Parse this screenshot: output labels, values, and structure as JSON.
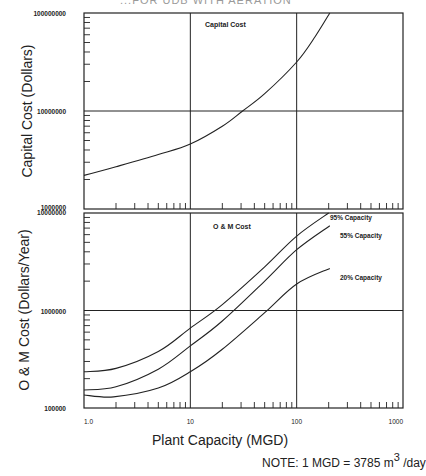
{
  "header": {
    "title_fragment": "...FOR UDB WITH AERATION"
  },
  "labels": {
    "top_ylabel": "Capital Cost (Dollars)",
    "bottom_ylabel": "O & M Cost (Dollars/Year)",
    "xlabel": "Plant Capacity (MGD)",
    "note_prefix": "NOTE: 1 MGD = 3785 m",
    "note_exp": "3",
    "note_suffix": " /day"
  },
  "chart_data": [
    {
      "type": "line",
      "title": "Capital Cost",
      "xlabel": "Plant Capacity (MGD)",
      "ylabel": "Capital Cost (Dollars)",
      "xscale": "log",
      "yscale": "log",
      "xlim": [
        1,
        1000
      ],
      "ylim": [
        1000000,
        100000000
      ],
      "x_tick_labels": [
        "1.0",
        "10",
        "100",
        "1000"
      ],
      "y_tick_labels": [
        "1000000",
        "10000000",
        "100000000"
      ],
      "grid": true,
      "series": [
        {
          "name": "Capital Cost",
          "x": [
            1,
            2,
            5,
            10,
            20,
            31,
            50,
            100,
            150,
            205
          ],
          "y": [
            2200000,
            2700000,
            3600000,
            4600000,
            7000000,
            10000000,
            15000000,
            31600000,
            58000000,
            100000000
          ]
        }
      ]
    },
    {
      "type": "line",
      "title": "O & M Cost",
      "xlabel": "Plant Capacity (MGD)",
      "ylabel": "O & M Cost (Dollars/Year)",
      "xscale": "log",
      "yscale": "log",
      "xlim": [
        1,
        1000
      ],
      "ylim": [
        100000,
        10000000
      ],
      "x_tick_labels": [
        "1.0",
        "10",
        "100",
        "1000"
      ],
      "y_tick_labels": [
        "100000",
        "1000000",
        "10000000"
      ],
      "grid": true,
      "legend_position": "inline-right",
      "series": [
        {
          "name": "95% Capacity",
          "x": [
            1,
            2,
            5,
            10,
            20,
            50,
            100,
            200
          ],
          "y": [
            235000,
            255000,
            380000,
            660000,
            1150000,
            2800000,
            5800000,
            10000000
          ]
        },
        {
          "name": "55% Capacity",
          "x": [
            1,
            2,
            5,
            10,
            20,
            50,
            100,
            205
          ],
          "y": [
            153000,
            165000,
            250000,
            433000,
            780000,
            2000000,
            4200000,
            7400000
          ]
        },
        {
          "name": "20% Capacity",
          "x": [
            1,
            1.9,
            5,
            10,
            20,
            50,
            100,
            205
          ],
          "y": [
            136000,
            130000,
            160000,
            235000,
            400000,
            950000,
            1870000,
            2700000
          ]
        }
      ]
    }
  ]
}
